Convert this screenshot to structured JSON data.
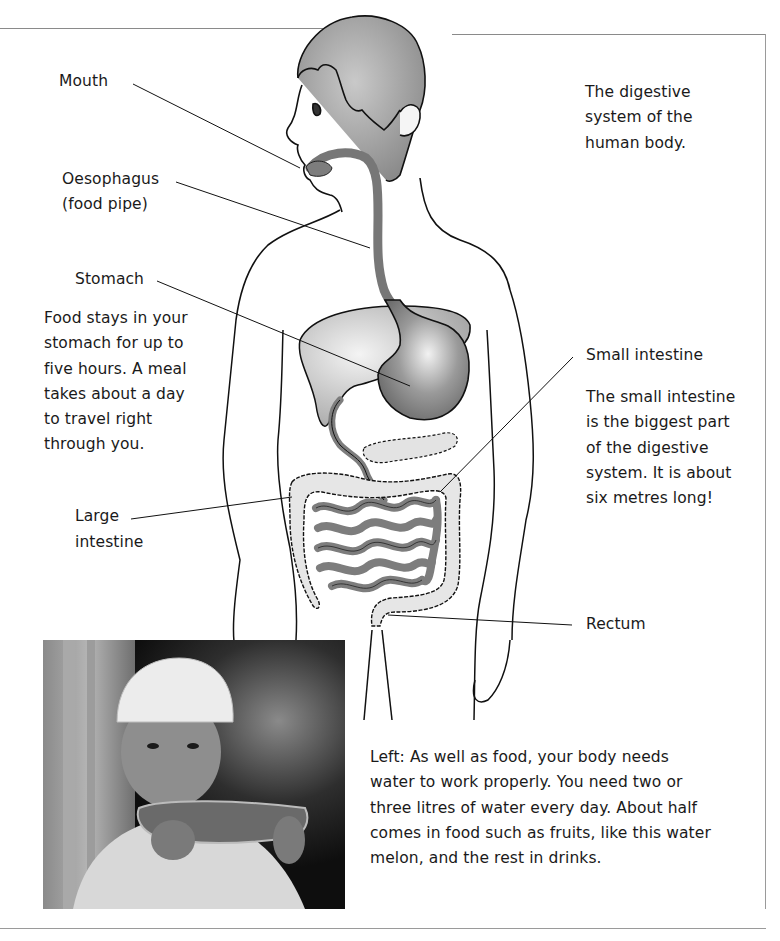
{
  "page": {
    "title": "The digestive system of the human body.",
    "labels": {
      "mouth": "Mouth",
      "oesophagus_line1": "Oesophagus",
      "oesophagus_line2": "(food pipe)",
      "stomach": "Stomach",
      "large_intestine_line1": "Large",
      "large_intestine_line2": "intestine",
      "small_intestine": "Small intestine",
      "rectum": "Rectum"
    },
    "title_lines": [
      "The digestive",
      "system of the",
      "human body."
    ],
    "stomach_note_lines": [
      "Food stays in your",
      "stomach for up to",
      "five hours. A meal",
      "takes about a day",
      "to travel right",
      "through you."
    ],
    "small_intestine_note_lines": [
      "The small intestine",
      "is the biggest part",
      "of the digestive",
      "system. It is about",
      "six metres long!"
    ],
    "photo_caption_lines": [
      "Left: As well as food, your body needs",
      "water to work properly. You need two or",
      "three litres of water every day. About half",
      "comes in food such as fruits, like this water",
      "melon, and the rest in drinks."
    ],
    "photo": {
      "subject": "Boy in white cap eating a slice of watermelon"
    }
  },
  "colors": {
    "organ_dark": "#7d7d7d",
    "organ_mid": "#a8a8a8",
    "organ_light": "#d4d4d4",
    "hair": "#9a9a9a",
    "outline": "#111111",
    "frame": "#8a8a8a"
  }
}
